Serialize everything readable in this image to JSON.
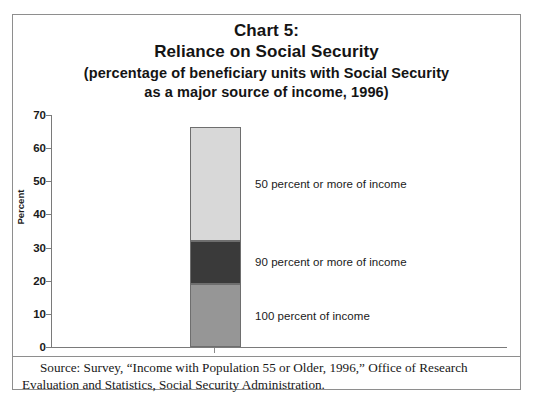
{
  "title": {
    "line1": "Chart 5:",
    "line2": "Reliance on Social Security",
    "line3": "(percentage of beneficiary units with Social Security",
    "line4": "as a major source of income, 1996)"
  },
  "source": {
    "text": "Source: Survey, “Income with Population 55 or Older, 1996,” Office of Research Evaluation and Statistics, Social Security Administration."
  },
  "chart_data": {
    "type": "bar",
    "subtype": "stacked-single-bar",
    "title": "Chart 5: Reliance on Social Security",
    "subtitle": "(percentage of beneficiary units with Social Security as a major source of income, 1996)",
    "xlabel": "",
    "ylabel": "Percent",
    "ylim": [
      0,
      70
    ],
    "ytick_values": [
      0,
      10,
      20,
      30,
      40,
      50,
      60,
      70
    ],
    "ytick_labels": [
      "0",
      "10",
      "20",
      "30",
      "40",
      "50",
      "60",
      "70"
    ],
    "grid": false,
    "legend_position": "inline-right-of-bar",
    "categories": [
      "1996"
    ],
    "total": 66.5,
    "series": [
      {
        "name": "100 percent of income",
        "values": [
          19
        ],
        "color": "#969696",
        "range": [
          0,
          19
        ],
        "label": "100 percent of income"
      },
      {
        "name": "90 percent or more of income",
        "values": [
          13
        ],
        "color": "#3a3a3a",
        "range": [
          19,
          32
        ],
        "label": "90 percent or more of income"
      },
      {
        "name": "50 percent or more of income",
        "values": [
          34.5
        ],
        "color": "#d8d8d8",
        "range": [
          32,
          66.5
        ],
        "label": "50 percent or more of income"
      }
    ],
    "annotations": [
      "50 percent or more of income",
      "90 percent or more of income",
      "100 percent of income"
    ]
  },
  "colors": {
    "segment_top": "#d8d8d8",
    "segment_middle": "#3a3a3a",
    "segment_bottom": "#969696",
    "axis": "#7a7a7a",
    "frame": "#8e8e8e",
    "text": "#1a1a1a"
  }
}
